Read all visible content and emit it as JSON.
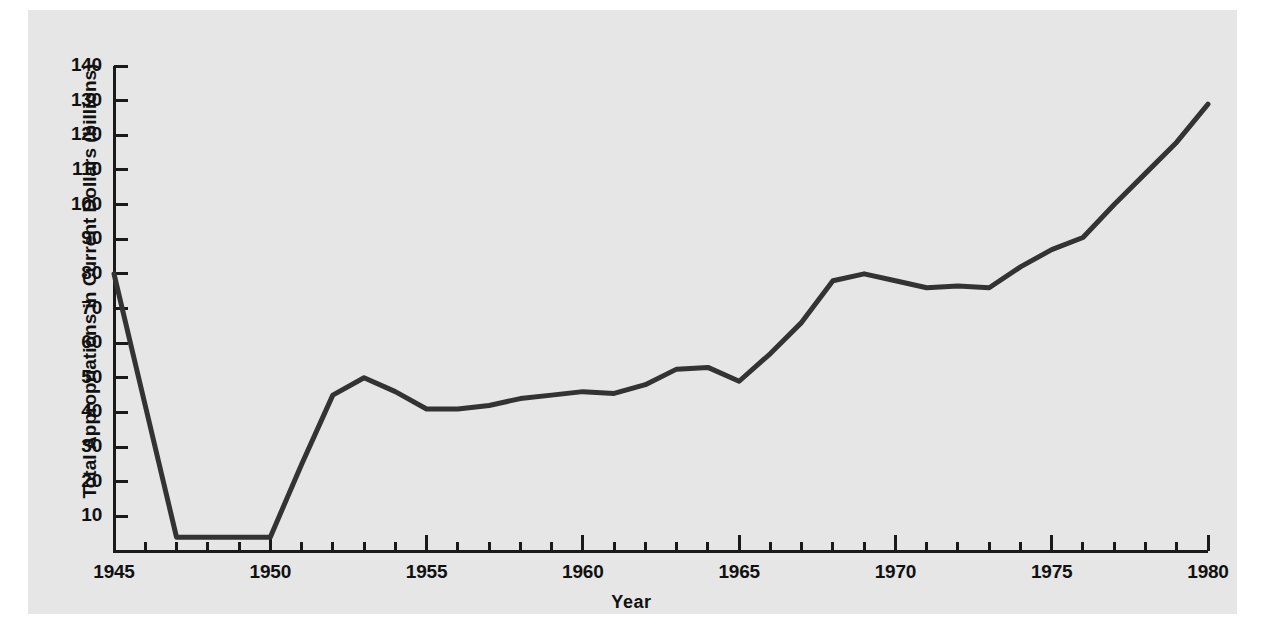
{
  "chart_data": {
    "type": "line",
    "title": "",
    "xlabel": "Year",
    "ylabel": "Total Appropriations in Current Dollars (billions)",
    "xlim": [
      1945,
      1980
    ],
    "ylim": [
      0,
      140
    ],
    "grid": false,
    "legend": null,
    "x_tick_labels": [
      "1945",
      "1950",
      "1955",
      "1960",
      "1965",
      "1970",
      "1975",
      "1980"
    ],
    "x_tick_values": [
      1945,
      1950,
      1955,
      1960,
      1965,
      1970,
      1975,
      1980
    ],
    "x_minor_tick_interval": 1,
    "y_tick_labels": [
      "10",
      "20",
      "30",
      "40",
      "50",
      "60",
      "70",
      "80",
      "90",
      "100",
      "110",
      "120",
      "130",
      "140"
    ],
    "y_tick_values": [
      10,
      20,
      30,
      40,
      50,
      60,
      70,
      80,
      90,
      100,
      110,
      120,
      130,
      140
    ],
    "series": [
      {
        "name": "Total Appropriations",
        "color": "#333333",
        "x": [
          1945,
          1946,
          1947,
          1948,
          1949,
          1950,
          1951,
          1952,
          1953,
          1954,
          1955,
          1956,
          1957,
          1958,
          1959,
          1960,
          1961,
          1962,
          1963,
          1964,
          1965,
          1966,
          1967,
          1968,
          1969,
          1970,
          1971,
          1972,
          1973,
          1974,
          1975,
          1976,
          1977,
          1978,
          1979,
          1980
        ],
        "values": [
          80,
          42,
          4,
          4,
          4,
          4,
          25,
          45,
          50,
          46,
          41,
          41,
          42,
          44,
          45,
          46,
          45.5,
          48,
          52.5,
          53,
          49,
          57,
          66,
          78,
          80,
          78,
          76,
          76.5,
          76,
          82,
          87,
          90.5,
          100,
          109,
          118,
          129
        ]
      }
    ]
  },
  "axis_geometry": {
    "x_pixel_left": 114,
    "x_pixel_right": 1208,
    "y_pixel_zero": 551,
    "y_pixel_top": 66
  },
  "colors": {
    "panel_background": "#e6e6e6",
    "page_background": "#ffffff",
    "line": "#333333",
    "axis": "#1a1a1a",
    "text": "#111111"
  }
}
